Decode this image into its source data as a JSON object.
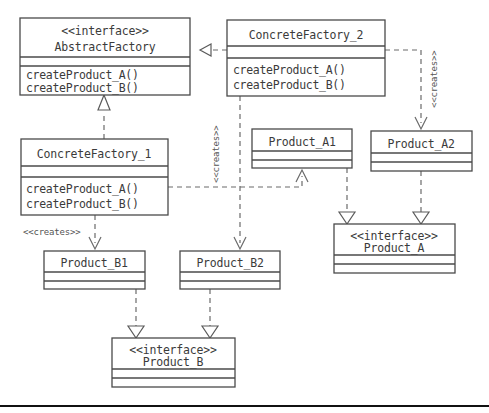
{
  "diagram": {
    "stereotype_interface": "<<interface>>",
    "stereotype_creates": "<<creates>>",
    "colors": {
      "background": "#ffffff",
      "box_stroke": "#4a4a4a",
      "text": "#3b3b3b",
      "edge": "#6b6b6b",
      "label": "#555555",
      "baseline": "#111111"
    },
    "classes": {
      "abstract_factory": {
        "stereotype": "<<interface>>",
        "name": "AbstractFactory",
        "method_a": "createProduct_A()",
        "method_b": "createProduct_B()"
      },
      "concrete_factory_2": {
        "name": "ConcreteFactory_2",
        "method_a": "createProduct_A()",
        "method_b": "createProduct_B()"
      },
      "concrete_factory_1": {
        "name": "ConcreteFactory_1",
        "method_a": "createProduct_A()",
        "method_b": "createProduct_B()"
      },
      "product_a1": {
        "name": "Product_A1"
      },
      "product_a2": {
        "name": "Product_A2"
      },
      "product_b1": {
        "name": "Product_B1"
      },
      "product_b2": {
        "name": "Product_B2"
      },
      "product_a_interface": {
        "stereotype": "<<interface>>",
        "name": "Product_A"
      },
      "product_b_interface": {
        "stereotype": "<<interface>>",
        "name": "Product_B"
      }
    },
    "edge_labels": {
      "creates_cf1_to_b1": "<<creates>>",
      "creates_cf1_to_b2": "<<creates>>",
      "creates_cf2_to_a1": "<<creates>>",
      "creates_cf2_to_a2": "<<creates>>"
    },
    "relationships": [
      {
        "from": "ConcreteFactory_2",
        "to": "AbstractFactory",
        "type": "realization"
      },
      {
        "from": "ConcreteFactory_1",
        "to": "AbstractFactory",
        "type": "realization"
      },
      {
        "from": "ConcreteFactory_1",
        "to": "Product_B1",
        "type": "creates"
      },
      {
        "from": "ConcreteFactory_1",
        "to": "Product_A1",
        "type": "creates"
      },
      {
        "from": "ConcreteFactory_2",
        "to": "Product_B2",
        "type": "creates"
      },
      {
        "from": "ConcreteFactory_2",
        "to": "Product_A2",
        "type": "creates"
      },
      {
        "from": "Product_A1",
        "to": "Product_A",
        "type": "realization"
      },
      {
        "from": "Product_A2",
        "to": "Product_A",
        "type": "realization"
      },
      {
        "from": "Product_B1",
        "to": "Product_B",
        "type": "realization"
      },
      {
        "from": "Product_B2",
        "to": "Product_B",
        "type": "realization"
      }
    ]
  }
}
